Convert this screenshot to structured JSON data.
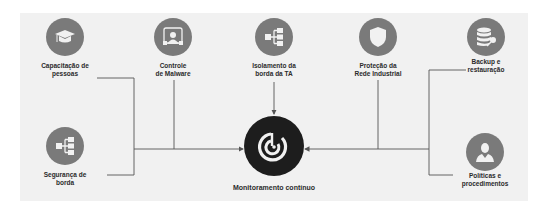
{
  "diagram": {
    "center": {
      "label": "Monitoramento contínuo",
      "icon": "radar-icon"
    },
    "nodes": [
      {
        "id": "capacitacao",
        "line1": "Capacitação de",
        "line2": "pessoas",
        "icon": "graduation-cap-icon"
      },
      {
        "id": "malware",
        "line1": "Controle",
        "line2": "de Malware",
        "icon": "malware-monitor-icon"
      },
      {
        "id": "isolamento",
        "line1": "Isolamento da",
        "line2": "borda da TA",
        "icon": "network-hierarchy-icon"
      },
      {
        "id": "protecao",
        "line1": "Proteção da",
        "line2": "Rede Industrial",
        "icon": "shield-icon"
      },
      {
        "id": "backup",
        "line1": "Backup e",
        "line2": "restauração",
        "icon": "database-key-icon"
      },
      {
        "id": "seguranca",
        "line1": "Segurança de",
        "line2": "borda",
        "icon": "network-hierarchy-icon"
      },
      {
        "id": "politicas",
        "line1": "Políticas e",
        "line2": "procedimentos",
        "icon": "person-icon"
      }
    ],
    "colors": {
      "panel": "#f1f1f1",
      "node": "#7a7a7a",
      "center": "#1d1d1d",
      "line": "#555555",
      "text": "#2b2b2b"
    }
  }
}
